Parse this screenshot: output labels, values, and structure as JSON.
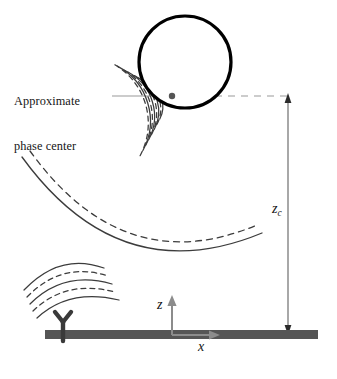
{
  "figure": {
    "width": 337,
    "height": 379,
    "background": "#ffffff"
  },
  "colors": {
    "wave_stroke": "#3c3c3c",
    "circle_stroke": "#000000",
    "ground_fill": "#555555",
    "axis_stroke": "#8c8c8c",
    "leader_stroke": "#9a9a9a",
    "dimension_stroke": "#6e6e6e",
    "text": "#151515",
    "phase_center_dot": "#555555"
  },
  "labels": {
    "phase_center_line1": "Approximate",
    "phase_center_line2": "phase center",
    "height_symbol": "z",
    "height_subscript": "c",
    "axis_z": "z",
    "axis_x": "x"
  },
  "elements": {
    "reflector_circle": {
      "name": "reflector-circle",
      "center_x": 185,
      "center_y": 62,
      "radius": 46,
      "stroke_width": 3.2
    },
    "phase_center_dot": {
      "name": "phase-center-dot",
      "x": 172,
      "y": 96,
      "radius": 3.2
    },
    "leader_line": {
      "name": "phase-center-leader",
      "x_start": 112,
      "x_end": 288,
      "y": 96,
      "solid_until": 140,
      "dash_pattern": "7 6"
    },
    "height_dimension": {
      "name": "zc-dimension-line",
      "x": 288,
      "y_top": 96,
      "y_bottom": 332,
      "arrow_top": true,
      "arrow_bottom": true
    },
    "ground_plane": {
      "name": "ground-plane",
      "x": 45,
      "y": 330,
      "width": 273,
      "height": 9
    },
    "antenna": {
      "name": "antenna-marker",
      "x": 63,
      "y": 334,
      "glyph": "Y"
    },
    "axis_origin": {
      "name": "axis-origin",
      "x": 172,
      "y": 335,
      "z_arrow_length": 37,
      "x_arrow_length": 46
    }
  },
  "wave_groups": [
    {
      "name": "wavefronts-from-phase-center",
      "center_x": 172,
      "center_y": 96,
      "start_angle_deg": 118,
      "end_angle_deg": 208,
      "radii": [
        26,
        32,
        38,
        44,
        50,
        56,
        62,
        68
      ],
      "styles": [
        "solid",
        "dashed",
        "solid",
        "dashed",
        "solid",
        "dashed",
        "solid",
        "dashed"
      ]
    },
    {
      "name": "wavefront-large-reflected",
      "center_x": 150,
      "center_y": 55,
      "radii": [
        182,
        191
      ],
      "styles": [
        "solid",
        "dashed"
      ],
      "start_angle_deg": 100,
      "end_angle_deg": 182
    },
    {
      "name": "wavefronts-lower-left",
      "center_x": 148,
      "center_y": 210,
      "radii": [
        88,
        95,
        102,
        109,
        116
      ],
      "styles": [
        "solid",
        "dashed",
        "solid",
        "dashed",
        "solid"
      ],
      "start_angle_deg": 150,
      "end_angle_deg": 213
    }
  ]
}
